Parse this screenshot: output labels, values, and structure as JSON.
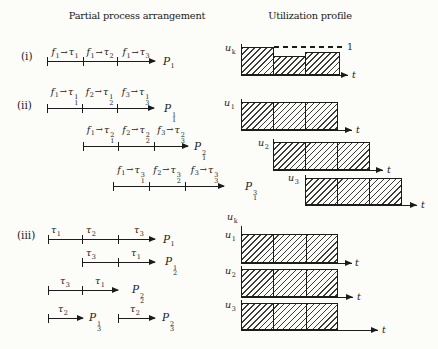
{
  "titles": {
    "arrangement": "Partial process arrangement",
    "utilization": "Utilization profile"
  },
  "mathsym": {
    "arrow": "→"
  },
  "s1": {
    "label": "(i)",
    "segs": [
      {
        "f": "f",
        "fs": "1",
        "tau": "τ",
        "ts": "1"
      },
      {
        "f": "f",
        "fs": "1",
        "tau": "τ",
        "ts": "2"
      },
      {
        "f": "f",
        "fs": "1",
        "tau": "τ",
        "ts": "3"
      }
    ],
    "proc": {
      "b": "P",
      "sb": "1"
    },
    "prof": {
      "ub": "u",
      "us": "k",
      "one": "1",
      "t": "t"
    }
  },
  "s2": {
    "label": "(ii)",
    "lines": [
      {
        "segs": [
          {
            "f": "f",
            "fs": "1",
            "tau": "τ",
            "ts": "1",
            "tp": "1"
          },
          {
            "f": "f",
            "fs": "2",
            "tau": "τ",
            "ts": "2",
            "tp": "1"
          },
          {
            "f": "f",
            "fs": "3",
            "tau": "τ",
            "ts": "3",
            "tp": "1"
          }
        ],
        "proc": {
          "b": "P",
          "sb": "1",
          "sp": "1"
        }
      },
      {
        "segs": [
          {
            "f": "f",
            "fs": "1",
            "tau": "τ",
            "ts": "1",
            "tp": "2"
          },
          {
            "f": "f",
            "fs": "2",
            "tau": "τ",
            "ts": "2",
            "tp": "2"
          },
          {
            "f": "f",
            "fs": "3",
            "tau": "τ",
            "ts": "3",
            "tp": "2"
          }
        ],
        "proc": {
          "b": "P",
          "sb": "1",
          "sp": "2"
        }
      },
      {
        "segs": [
          {
            "f": "f",
            "fs": "1",
            "tau": "τ",
            "ts": "1",
            "tp": "3"
          },
          {
            "f": "f",
            "fs": "2",
            "tau": "τ",
            "ts": "2",
            "tp": "3"
          },
          {
            "f": "f",
            "fs": "3",
            "tau": "τ",
            "ts": "3",
            "tp": "3"
          }
        ],
        "proc": {
          "b": "P",
          "sb": "1",
          "sp": "3"
        }
      }
    ],
    "profs": [
      {
        "ub": "u",
        "us": "1",
        "t": "t"
      },
      {
        "ub": "u",
        "us": "2",
        "t": "t"
      },
      {
        "ub": "u",
        "us": "3",
        "t": "t"
      }
    ]
  },
  "s3": {
    "label": "(iii)",
    "axis": {
      "ub": "u",
      "us": "k"
    },
    "lines": [
      {
        "segs": [
          {
            "tau": "τ",
            "ts": "1"
          },
          {
            "tau": "τ",
            "ts": "2"
          },
          {
            "tau": "τ",
            "ts": "3"
          }
        ],
        "proc": {
          "b": "P",
          "sb": "1"
        }
      },
      {
        "segs": [
          {
            "tau": "τ",
            "ts": "3"
          },
          {
            "tau": "τ",
            "ts": "1"
          }
        ],
        "proc": {
          "b": "P",
          "sb": "2",
          "sp": "1"
        }
      },
      {
        "segs": [
          {
            "tau": "τ",
            "ts": "3"
          },
          {
            "tau": "τ",
            "ts": "1"
          }
        ],
        "proc": {
          "b": "P",
          "sb": "2",
          "sp": "2"
        }
      },
      {
        "segs": [
          {
            "tau": "τ",
            "ts": "2"
          }
        ],
        "proc": {
          "b": "P",
          "sb": "3",
          "sp": "1"
        }
      },
      {
        "segs": [
          {
            "tau": "τ",
            "ts": "2"
          }
        ],
        "proc": {
          "b": "P",
          "sb": "3",
          "sp": "2"
        }
      }
    ],
    "profs": [
      {
        "ub": "u",
        "us": "1",
        "t": "t"
      },
      {
        "ub": "u",
        "us": "2",
        "t": "t"
      },
      {
        "ub": "u",
        "us": "3",
        "t": "t"
      }
    ]
  }
}
